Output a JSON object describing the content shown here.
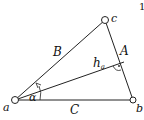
{
  "figure": {
    "number": "1",
    "vertices": [
      {
        "id": "a",
        "label": "a",
        "x": 15,
        "y": 100
      },
      {
        "id": "b",
        "label": "b",
        "x": 133,
        "y": 100
      },
      {
        "id": "c",
        "label": "c",
        "x": 105,
        "y": 20
      }
    ],
    "sides": [
      {
        "id": "A",
        "label": "A",
        "from": "b",
        "to": "c"
      },
      {
        "id": "B",
        "label": "B",
        "from": "a",
        "to": "c"
      },
      {
        "id": "C",
        "label": "C",
        "from": "a",
        "to": "b"
      }
    ],
    "altitude": {
      "label": "h",
      "subscript": "a",
      "from": "a",
      "foot": {
        "x": 124,
        "y": 62
      }
    },
    "angle": {
      "label": "α",
      "vertex": "a"
    },
    "colors": {
      "stroke": "#222222",
      "background": "#ffffff"
    }
  }
}
